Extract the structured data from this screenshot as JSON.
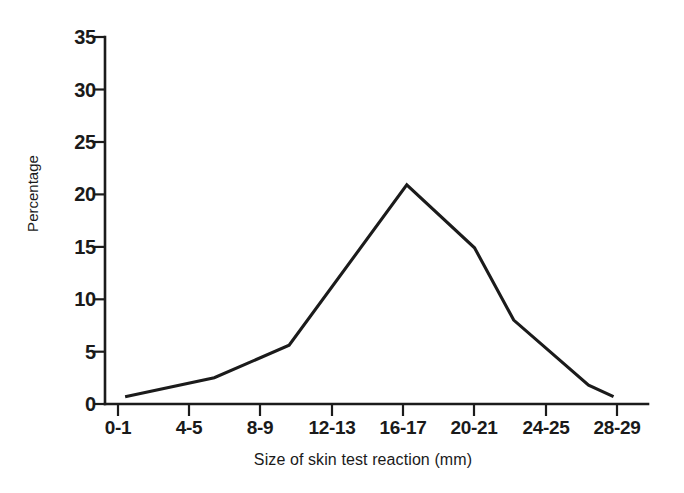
{
  "chart_data": {
    "type": "line",
    "title": "",
    "xlabel": "Size of skin test reaction (mm)",
    "ylabel": "Percentage",
    "grid": false,
    "legend": null,
    "ylim": [
      0,
      35
    ],
    "yticks": [
      0,
      5,
      10,
      15,
      20,
      25,
      30,
      35
    ],
    "ytick_labels": [
      "0",
      "5",
      "10",
      "15",
      "20",
      "25",
      "30",
      "35"
    ],
    "categories": [
      "0-1",
      "4-5",
      "8-9",
      "12-13",
      "16-17",
      "20-21",
      "24-25",
      "28-29"
    ],
    "xtick_labels": [
      "0-1",
      "4-5",
      "8-9",
      "12-13",
      "16-17",
      "20-21",
      "24-25",
      "28-29"
    ],
    "x": [
      0.1,
      1.35,
      2.4,
      4.05,
      5.0,
      5.55,
      6.6,
      6.95
    ],
    "values": [
      0.7,
      2.5,
      5.6,
      20.9,
      14.9,
      8.0,
      1.8,
      0.7
    ],
    "line_color": "#1b1b1b",
    "axis_color": "#1b1b1b",
    "background_color": "#ffffff",
    "points": [
      {
        "x": 0.1,
        "y": 0.7
      },
      {
        "x": 1.35,
        "y": 2.5
      },
      {
        "x": 2.4,
        "y": 5.6
      },
      {
        "x": 4.05,
        "y": 20.9
      },
      {
        "x": 5.0,
        "y": 14.9
      },
      {
        "x": 5.55,
        "y": 8.0
      },
      {
        "x": 6.6,
        "y": 1.8
      },
      {
        "x": 6.95,
        "y": 0.7
      }
    ]
  }
}
